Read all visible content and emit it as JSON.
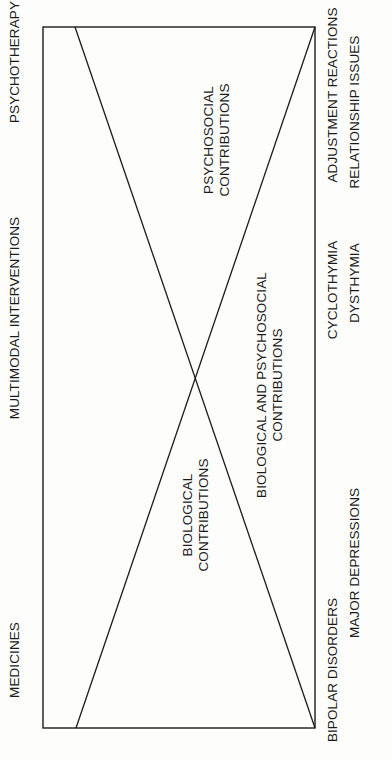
{
  "diagram": {
    "orientation": "rotated-90-ccw",
    "colors": {
      "background": "#fdfdfb",
      "ink": "#1a1a1a"
    },
    "interventions": {
      "top": "PSYCHOTHERAPY",
      "middle": "MULTIMODAL INTERVENTIONS",
      "bottom": "MEDICINES"
    },
    "regions": {
      "psychosocial": {
        "line1": "PSYCHOSOCIAL",
        "line2": "CONTRIBUTIONS"
      },
      "biological": {
        "line1": "BIOLOGICAL",
        "line2": "CONTRIBUTIONS"
      },
      "combined": {
        "line1": "BIOLOGICAL AND PSYCHOSOCIAL",
        "line2": "CONTRIBUTIONS"
      }
    },
    "conditions": {
      "row1": {
        "top": "ADJUSTMENT REACTIONS",
        "middle": "CYCLOTHYMIA",
        "bottom": "BIPOLAR DISORDERS"
      },
      "row2": {
        "top": "RELATIONSHIP ISSUES",
        "middle": "DYSTHYMIA",
        "bottom": "MAJOR DEPRESSIONS"
      }
    }
  }
}
